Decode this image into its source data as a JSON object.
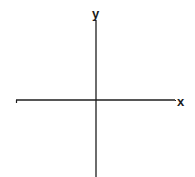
{
  "diagram": {
    "type": "cartesian-axes",
    "x_axis_label": "x",
    "y_axis_label": "y",
    "line_color": "#1e1e1e",
    "background": "#ffffff"
  }
}
